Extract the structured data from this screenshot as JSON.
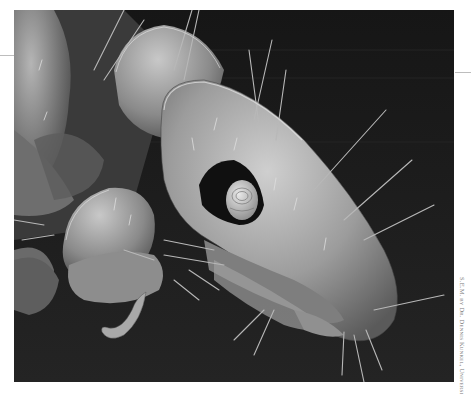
{
  "figure": {
    "background_color": "#1c1c1c",
    "specimen_tone": "#9a9a9a",
    "highlight_tone": "#d9d9d9"
  },
  "credit": {
    "text": "S.E.M. by Dr. Dennis Kunkel, University of Hawaii"
  }
}
